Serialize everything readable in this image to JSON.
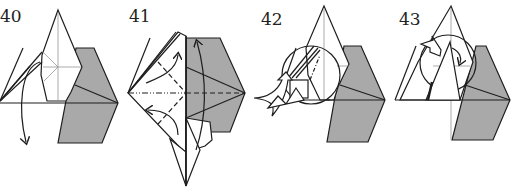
{
  "diagram": {
    "type": "origami-instructions",
    "colors": {
      "paper_back": "#a9a9a9",
      "paper_front": "#ffffff",
      "line": "#1e1e1e",
      "crease": "#777777"
    },
    "steps": [
      {
        "number": "40",
        "description": "Swing flap down (curved arrow)"
      },
      {
        "number": "41",
        "description": "Valley and mountain fold lines with curved arrows"
      },
      {
        "number": "42",
        "description": "Detail circle with push arrow"
      },
      {
        "number": "43",
        "description": "Detail circle with rotation arrow"
      }
    ]
  }
}
